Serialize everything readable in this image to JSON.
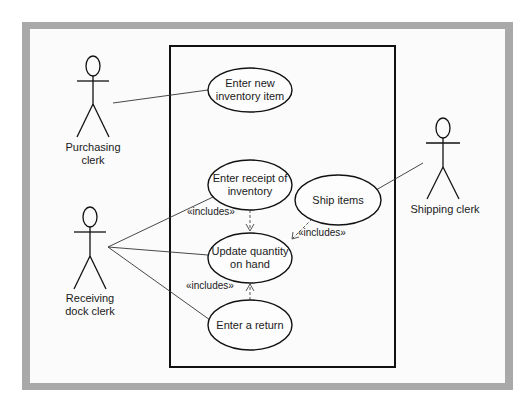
{
  "diagram": {
    "type": "UML use case diagram",
    "colors": {
      "frame": "#a9a9a9",
      "background": "#fbfbfb",
      "ink": "#1a1a1a"
    },
    "actors": [
      {
        "id": "purchasing",
        "label_line1": "Purchasing",
        "label_line2": "clerk"
      },
      {
        "id": "receiving",
        "label_line1": "Receiving",
        "label_line2": "dock clerk"
      },
      {
        "id": "shipping",
        "label_line1": "Shipping clerk",
        "label_line2": ""
      }
    ],
    "use_cases": [
      {
        "id": "enter_new",
        "line1": "Enter new",
        "line2": "inventory item"
      },
      {
        "id": "enter_receipt",
        "line1": "Enter receipt of",
        "line2": "inventory"
      },
      {
        "id": "update_qty",
        "line1": "Update quantity",
        "line2": "on hand"
      },
      {
        "id": "enter_return",
        "line1": "Enter a return",
        "line2": ""
      },
      {
        "id": "ship_items",
        "line1": "Ship items",
        "line2": ""
      }
    ],
    "relationships": [
      {
        "from": "purchasing",
        "to": "enter_new",
        "kind": "association"
      },
      {
        "from": "receiving",
        "to": "enter_receipt",
        "kind": "association"
      },
      {
        "from": "receiving",
        "to": "update_qty",
        "kind": "association"
      },
      {
        "from": "receiving",
        "to": "enter_return",
        "kind": "association"
      },
      {
        "from": "shipping",
        "to": "ship_items",
        "kind": "association"
      },
      {
        "from": "enter_receipt",
        "to": "update_qty",
        "kind": "include",
        "label": "«includes»"
      },
      {
        "from": "ship_items",
        "to": "update_qty",
        "kind": "include",
        "label": "«includes»"
      },
      {
        "from": "enter_return",
        "to": "update_qty",
        "kind": "include",
        "label": "«includes»"
      }
    ]
  }
}
